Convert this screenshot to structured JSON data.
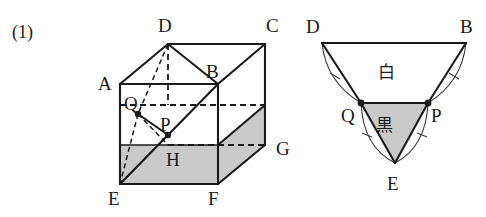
{
  "problem": {
    "number_label": "(1)"
  },
  "colors": {
    "ink": "#1a1a1a",
    "shade_gray": "#c9c9c9",
    "arc_gray": "#3a3a3a",
    "background": "#ffffff"
  },
  "cube_diagram": {
    "name": "cube-with-cut-plane",
    "vertex_labels": {
      "A": "A",
      "B": "B",
      "C": "C",
      "D": "D",
      "E": "E",
      "F": "F",
      "G": "G",
      "H": "H"
    },
    "point_labels": {
      "P": "P",
      "Q": "Q"
    },
    "vertices": [
      {
        "id": "A",
        "label": "A",
        "x": 120,
        "y": 84,
        "label_x": 98,
        "label_y": 90
      },
      {
        "id": "B",
        "label": "B",
        "x": 218,
        "y": 84,
        "label_x": 206,
        "label_y": 78
      },
      {
        "id": "C",
        "label": "C",
        "x": 265,
        "y": 44,
        "label_x": 266,
        "label_y": 32
      },
      {
        "id": "D",
        "label": "D",
        "x": 168,
        "y": 44,
        "label_x": 158,
        "label_y": 32
      },
      {
        "id": "E",
        "label": "E",
        "x": 120,
        "y": 184,
        "label_x": 108,
        "label_y": 205
      },
      {
        "id": "F",
        "label": "F",
        "x": 218,
        "y": 184,
        "label_x": 208,
        "label_y": 205
      },
      {
        "id": "G",
        "label": "G",
        "x": 265,
        "y": 145,
        "label_x": 276,
        "label_y": 155
      },
      {
        "id": "H",
        "label": "H",
        "x": 168,
        "y": 145,
        "label_x": 166,
        "label_y": 166
      },
      {
        "id": "P",
        "label": "P",
        "x": 168,
        "y": 135,
        "label_x": 160,
        "label_y": 131
      },
      {
        "id": "Q",
        "label": "Q",
        "x": 138,
        "y": 114,
        "label_x": 124,
        "label_y": 110
      }
    ]
  },
  "net_diagram": {
    "name": "unfolded-triangle-net",
    "vertex_labels": {
      "D": "D",
      "B": "B",
      "E": "E",
      "P": "P",
      "Q": "Q"
    },
    "region_labels": {
      "white": "白",
      "black": "黒"
    },
    "vertices": [
      {
        "id": "D",
        "label": "D",
        "x": 322,
        "y": 43,
        "label_x": 306,
        "label_y": 33
      },
      {
        "id": "B",
        "label": "B",
        "x": 466,
        "y": 43,
        "label_x": 460,
        "label_y": 33
      },
      {
        "id": "Q",
        "label": "Q",
        "x": 361,
        "y": 103,
        "label_x": 341,
        "label_y": 122
      },
      {
        "id": "P",
        "label": "P",
        "x": 428,
        "y": 103,
        "label_x": 431,
        "label_y": 122
      },
      {
        "id": "E",
        "label": "E",
        "x": 395,
        "y": 163,
        "label_x": 387,
        "label_y": 190
      }
    ],
    "regions": [
      {
        "id": "white-region",
        "label": "白",
        "label_x": 386,
        "label_y": 78
      },
      {
        "id": "black-region",
        "label": "黒",
        "label_x": 384,
        "label_y": 131
      }
    ]
  }
}
